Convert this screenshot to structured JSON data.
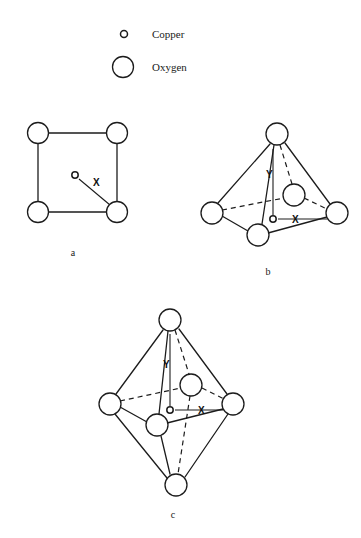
{
  "figure": {
    "background_color": "#ffffff",
    "stroke_color": "#1c1c1c",
    "legend": {
      "copper": {
        "label": "Copper",
        "marker": "small-open-circle",
        "radius": 3.5,
        "cx": 124,
        "cy": 34
      },
      "oxygen": {
        "label": "Oxygen",
        "marker": "large-open-circle",
        "radius": 10.5,
        "cx": 123,
        "cy": 67
      },
      "text_x": 152
    },
    "panels": [
      {
        "id": "a",
        "label": "a",
        "caption_x": 73,
        "caption_y": 256,
        "geometry": "square-planar",
        "description": "Square planar arrangement of four oxygen atoms with a central copper atom",
        "oxygens": [
          {
            "name": "top-left",
            "cx": 38,
            "cy": 133,
            "r": 10.5
          },
          {
            "name": "top-right",
            "cx": 117,
            "cy": 133,
            "r": 10.5
          },
          {
            "name": "bottom-left",
            "cx": 38,
            "cy": 212,
            "r": 10.5
          },
          {
            "name": "bottom-right",
            "cx": 117,
            "cy": 212,
            "r": 10.5
          }
        ],
        "copper": {
          "cx": 75,
          "cy": 175,
          "r": 3.2
        },
        "bonds_solid": [
          [
            48.5,
            133,
            106.5,
            133
          ],
          [
            38,
            143.5,
            38,
            201.5
          ],
          [
            117,
            143.5,
            117,
            201.5
          ],
          [
            48.5,
            212,
            106.5,
            212
          ]
        ],
        "bonds_dashed": [],
        "distance_lines": [
          {
            "label": "X",
            "from": [
              79,
              179
            ],
            "to": [
              110,
              205
            ],
            "label_x": 93,
            "label_y": 186
          }
        ]
      },
      {
        "id": "b",
        "label": "b",
        "caption_x": 268,
        "caption_y": 275,
        "geometry": "square-pyramidal",
        "description": "Square pyramid with apical oxygen, four basal oxygens and central copper",
        "oxygens": [
          {
            "name": "apex",
            "cx": 277,
            "cy": 134,
            "r": 11
          },
          {
            "name": "left",
            "cx": 212,
            "cy": 213,
            "r": 11
          },
          {
            "name": "front-bottom",
            "cx": 258,
            "cy": 235,
            "r": 11
          },
          {
            "name": "right",
            "cx": 337,
            "cy": 213,
            "r": 11
          },
          {
            "name": "back",
            "cx": 294,
            "cy": 195,
            "r": 11
          }
        ],
        "copper": {
          "cx": 273,
          "cy": 219,
          "r": 3.2
        },
        "bonds_solid": [
          [
            270,
            144,
            218,
            203
          ],
          [
            274,
            145,
            262,
            224
          ],
          [
            285,
            143,
            330,
            204
          ],
          [
            222,
            216,
            248,
            231
          ],
          [
            268,
            233,
            327,
            217
          ]
        ],
        "bonds_dashed": [
          [
            280,
            145,
            292,
            184
          ],
          [
            222,
            210,
            284,
            198
          ],
          [
            304,
            198,
            327,
            209
          ]
        ],
        "axes": [
          {
            "label": "Y",
            "orientation": "vertical",
            "from": [
              273,
              215
            ],
            "to": [
              273,
              149
            ],
            "label_x": 266,
            "label_y": 178
          },
          {
            "label": "X",
            "orientation": "horizontal",
            "from": [
              278,
              219
            ],
            "to": [
              327,
              219
            ],
            "label_x": 292,
            "label_y": 223
          }
        ]
      },
      {
        "id": "c",
        "label": "c",
        "caption_x": 173,
        "caption_y": 518,
        "geometry": "octahedral",
        "description": "Octahedron with top and bottom apical oxygens, four equatorial oxygens and central copper",
        "oxygens": [
          {
            "name": "top-apex",
            "cx": 170,
            "cy": 320,
            "r": 11
          },
          {
            "name": "left",
            "cx": 110,
            "cy": 404,
            "r": 11
          },
          {
            "name": "front",
            "cx": 157,
            "cy": 425,
            "r": 11
          },
          {
            "name": "right",
            "cx": 233,
            "cy": 404,
            "r": 11
          },
          {
            "name": "back",
            "cx": 191,
            "cy": 385,
            "r": 11
          },
          {
            "name": "bottom-apex",
            "cx": 176,
            "cy": 485,
            "r": 11
          }
        ],
        "copper": {
          "cx": 170,
          "cy": 410,
          "r": 3.2
        },
        "bonds_solid": [
          [
            163,
            330,
            116,
            394
          ],
          [
            168,
            331,
            159,
            414
          ],
          [
            179,
            329,
            227,
            394
          ],
          [
            120,
            407,
            147,
            422
          ],
          [
            167,
            423,
            223,
            409
          ],
          [
            115,
            414,
            167,
            478
          ],
          [
            161,
            436,
            170,
            474
          ],
          [
            228,
            414,
            185,
            477
          ]
        ],
        "bonds_dashed": [
          [
            175,
            330,
            189,
            374
          ],
          [
            120,
            401,
            181,
            388
          ],
          [
            202,
            388,
            224,
            399
          ],
          [
            190,
            396,
            178,
            474
          ]
        ],
        "axes": [
          {
            "label": "Y",
            "orientation": "vertical",
            "from": [
              170,
              406
            ],
            "to": [
              170,
              334
            ],
            "label_x": 163,
            "label_y": 368
          },
          {
            "label": "X",
            "orientation": "horizontal",
            "from": [
              175,
              410
            ],
            "to": [
              223,
              410
            ],
            "label_x": 198,
            "label_y": 414
          }
        ]
      }
    ]
  }
}
